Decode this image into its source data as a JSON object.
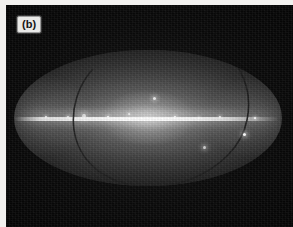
{
  "figure": {
    "panel_label": "(b)",
    "projection": "mollweide-all-sky-map",
    "colors": {
      "plate_background": "#0a0a0a",
      "page_background": "#f2f1ef",
      "label_background": "#e9e9e7",
      "label_text": "#141414",
      "galactic_plane": "#ffffff",
      "sky_mid": "#4a4a4a",
      "ecliptic_line": "#1c1c1c"
    }
  },
  "chart_data": {
    "type": "heatmap",
    "title": "(b)",
    "projection": "Mollweide all-sky (equal-area ellipse)",
    "xlabel": "",
    "ylabel": "",
    "grid": false,
    "legend": "none",
    "colormap": "grayscale",
    "ellipse": {
      "center_x_px": 142,
      "center_y_px": 113,
      "semi_major_px": 134,
      "semi_minor_px": 68
    },
    "features": [
      {
        "name": "galactic-plane",
        "description": "bright horizontal emission band across the ellipse centre",
        "y_fraction": 0.49,
        "peak_brightness": 1.0
      },
      {
        "name": "galactic-bulge",
        "description": "brightest diffuse concentration at map centre",
        "x_fraction": 0.5,
        "y_fraction": 0.49
      },
      {
        "name": "ecliptic",
        "description": "dark curved great-circle track crossing the map from upper right to lower left"
      },
      {
        "name": "diffuse-halo",
        "description": "broad grey glow filling the ellipse, fading toward the poles"
      }
    ],
    "point_sources": [
      {
        "x_fraction": 0.26,
        "y_fraction": 0.485,
        "size_px": 4
      },
      {
        "x_fraction": 0.2,
        "y_fraction": 0.49,
        "size_px": 2
      },
      {
        "x_fraction": 0.35,
        "y_fraction": 0.49,
        "size_px": 2
      },
      {
        "x_fraction": 0.43,
        "y_fraction": 0.47,
        "size_px": 2
      },
      {
        "x_fraction": 0.525,
        "y_fraction": 0.36,
        "size_px": 3
      },
      {
        "x_fraction": 0.6,
        "y_fraction": 0.49,
        "size_px": 2
      },
      {
        "x_fraction": 0.69,
        "y_fraction": 0.5,
        "size_px": 2
      },
      {
        "x_fraction": 0.77,
        "y_fraction": 0.49,
        "size_px": 2
      },
      {
        "x_fraction": 0.86,
        "y_fraction": 0.62,
        "size_px": 3
      },
      {
        "x_fraction": 0.71,
        "y_fraction": 0.72,
        "size_px": 3
      },
      {
        "x_fraction": 0.12,
        "y_fraction": 0.49,
        "size_px": 2
      },
      {
        "x_fraction": 0.9,
        "y_fraction": 0.5,
        "size_px": 2
      }
    ],
    "intensity_profile_along_plane": {
      "x_fractions": [
        0.0,
        0.05,
        0.12,
        0.2,
        0.3,
        0.4,
        0.5,
        0.6,
        0.7,
        0.8,
        0.9,
        1.0
      ],
      "values": [
        0.0,
        0.3,
        0.7,
        0.8,
        0.88,
        0.95,
        1.0,
        0.92,
        0.78,
        0.6,
        0.32,
        0.0
      ]
    }
  }
}
